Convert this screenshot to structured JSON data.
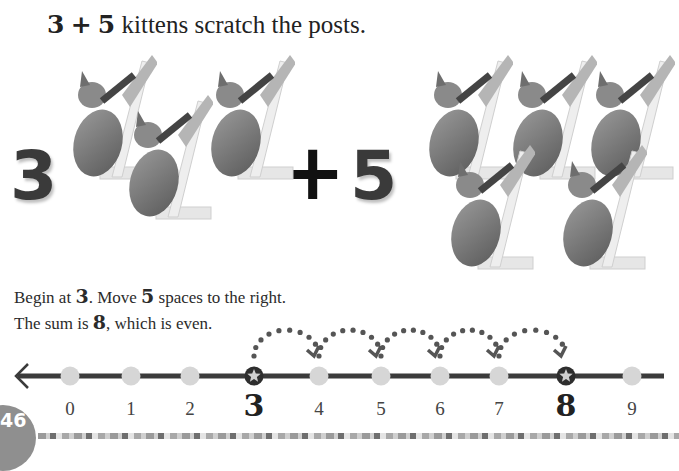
{
  "heading": {
    "addend_a": "3",
    "plus": "+",
    "addend_b": "5",
    "rest": " kittens scratch the posts."
  },
  "illustration": {
    "left_number": "3",
    "operator": "+",
    "right_number": "5",
    "left_kittens": 3,
    "right_kittens": 5,
    "image_icon": "kitten-scratching-post"
  },
  "description": {
    "line1_pre": "Begin at ",
    "line1_start": "3",
    "line1_mid": ". Move ",
    "line1_moves": "5",
    "line1_post": " spaces to the right.",
    "line2_pre": "The sum is ",
    "line2_sum": "8",
    "line2_post": ", which is even."
  },
  "number_line": {
    "ticks": [
      "0",
      "1",
      "2",
      "3",
      "4",
      "5",
      "6",
      "7",
      "8",
      "9"
    ],
    "start": 3,
    "end": 8,
    "hops": 5,
    "marker_icon": "star-icon",
    "colors": {
      "line": "#3b3b3b",
      "dot": "#d6d6d6",
      "marker": "#2e2e2e",
      "hop": "#555555"
    }
  },
  "footer": {
    "page_number": "46"
  }
}
